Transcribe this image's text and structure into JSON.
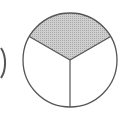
{
  "diagram": {
    "type": "fraction-circle",
    "parts": 3,
    "shaded_parts": 1,
    "fraction_label": "1/3",
    "colors": {
      "background": "#ffffff",
      "stroke": "#555555",
      "shade": "#c4c4c4"
    },
    "circle": {
      "cx": 70,
      "cy": 60,
      "r": 47
    },
    "partial_left_shape": {
      "visible": true
    }
  }
}
